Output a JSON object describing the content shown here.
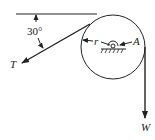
{
  "diagram": {
    "angle_label": "30°",
    "tension_label": "T",
    "radius_label": "r",
    "pivot_label": "A",
    "weight_label": "W",
    "stroke_color": "#222222"
  }
}
